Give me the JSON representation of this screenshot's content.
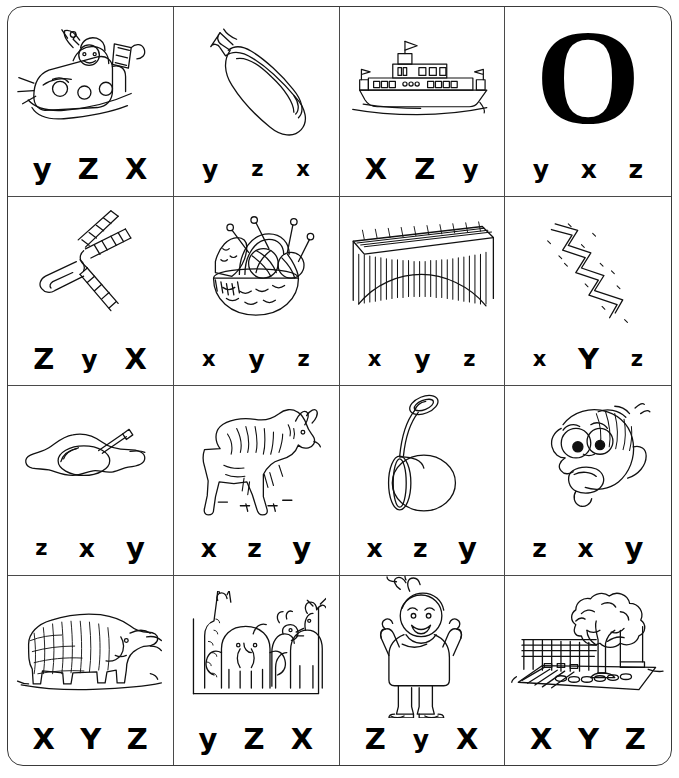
{
  "worksheet": {
    "title": "Beginning sound letter choice worksheet",
    "rows": 4,
    "columns": 4,
    "cells": [
      {
        "id": "cell-1",
        "picture": "santa-sleigh-icon",
        "picture_label": "sleigh",
        "choices": [
          {
            "letter": "y",
            "size": "l"
          },
          {
            "letter": "Z",
            "size": "l"
          },
          {
            "letter": "X",
            "size": "l"
          }
        ]
      },
      {
        "id": "cell-2",
        "picture": "zucchini-icon",
        "picture_label": "zucchini",
        "choices": [
          {
            "letter": "y",
            "size": "m"
          },
          {
            "letter": "z",
            "size": "s"
          },
          {
            "letter": "x",
            "size": "s"
          }
        ]
      },
      {
        "id": "cell-3",
        "picture": "yacht-icon",
        "picture_label": "yacht",
        "choices": [
          {
            "letter": "X",
            "size": "l"
          },
          {
            "letter": "Z",
            "size": "l"
          },
          {
            "letter": "y",
            "size": "m"
          }
        ]
      },
      {
        "id": "cell-4",
        "picture": "letter-o-icon",
        "picture_label": "letter O",
        "letter_display": "O",
        "choices": [
          {
            "letter": "y",
            "size": "m"
          },
          {
            "letter": "x",
            "size": "m"
          },
          {
            "letter": "z",
            "size": "m"
          }
        ]
      },
      {
        "id": "cell-5",
        "picture": "zipper-icon",
        "picture_label": "zipper",
        "choices": [
          {
            "letter": "Z",
            "size": "l"
          },
          {
            "letter": "y",
            "size": "m"
          },
          {
            "letter": "X",
            "size": "l"
          }
        ]
      },
      {
        "id": "cell-6",
        "picture": "yarn-basket-icon",
        "picture_label": "yarn basket",
        "choices": [
          {
            "letter": "x",
            "size": "s"
          },
          {
            "letter": "y",
            "size": "m"
          },
          {
            "letter": "z",
            "size": "s"
          }
        ]
      },
      {
        "id": "cell-7",
        "picture": "xylophone-icon",
        "picture_label": "xylophone",
        "choices": [
          {
            "letter": "x",
            "size": "s"
          },
          {
            "letter": "y",
            "size": "m"
          },
          {
            "letter": "z",
            "size": "s"
          }
        ]
      },
      {
        "id": "cell-8",
        "picture": "zigzag-icon",
        "picture_label": "zigzag",
        "choices": [
          {
            "letter": "x",
            "size": "s"
          },
          {
            "letter": "Y",
            "size": "l"
          },
          {
            "letter": "z",
            "size": "s"
          }
        ]
      },
      {
        "id": "cell-9",
        "picture": "egg-yolk-icon",
        "picture_label": "yolk",
        "choices": [
          {
            "letter": "z",
            "size": "s"
          },
          {
            "letter": "x",
            "size": "m"
          },
          {
            "letter": "y",
            "size": "l"
          }
        ]
      },
      {
        "id": "cell-10",
        "picture": "zebra-icon",
        "picture_label": "zebra",
        "choices": [
          {
            "letter": "x",
            "size": "m"
          },
          {
            "letter": "z",
            "size": "m"
          },
          {
            "letter": "y",
            "size": "l"
          }
        ]
      },
      {
        "id": "cell-11",
        "picture": "yoyo-icon",
        "picture_label": "yo-yo",
        "choices": [
          {
            "letter": "x",
            "size": "m"
          },
          {
            "letter": "z",
            "size": "m"
          },
          {
            "letter": "y",
            "size": "l"
          }
        ]
      },
      {
        "id": "cell-12",
        "picture": "yelling-face-icon",
        "picture_label": "yell",
        "choices": [
          {
            "letter": "z",
            "size": "m"
          },
          {
            "letter": "x",
            "size": "m"
          },
          {
            "letter": "y",
            "size": "l"
          }
        ]
      },
      {
        "id": "cell-13",
        "picture": "yak-icon",
        "picture_label": "yak",
        "choices": [
          {
            "letter": "X",
            "size": "l"
          },
          {
            "letter": "Y",
            "size": "l"
          },
          {
            "letter": "Z",
            "size": "l"
          }
        ]
      },
      {
        "id": "cell-14",
        "picture": "zoo-animals-icon",
        "picture_label": "zoo",
        "choices": [
          {
            "letter": "y",
            "size": "l"
          },
          {
            "letter": "Z",
            "size": "l"
          },
          {
            "letter": "X",
            "size": "l"
          }
        ]
      },
      {
        "id": "cell-15",
        "picture": "cheering-boy-icon",
        "picture_label": "yay",
        "choices": [
          {
            "letter": "Z",
            "size": "l"
          },
          {
            "letter": "y",
            "size": "m"
          },
          {
            "letter": "X",
            "size": "l"
          }
        ]
      },
      {
        "id": "cell-16",
        "picture": "yard-tree-swing-icon",
        "picture_label": "yard",
        "choices": [
          {
            "letter": "X",
            "size": "l"
          },
          {
            "letter": "Y",
            "size": "l"
          },
          {
            "letter": "Z",
            "size": "l"
          }
        ]
      }
    ]
  },
  "colors": {
    "ink": "#000000",
    "grid": "#4a4a4a",
    "outer_border": "#3a3a3a",
    "background": "#ffffff"
  }
}
